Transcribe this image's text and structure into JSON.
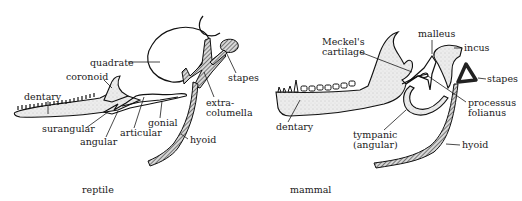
{
  "figure": {
    "panels": [
      {
        "id": "reptile",
        "caption": "reptile",
        "labels": {
          "quadrate": "quadrate",
          "coronoid": "coronoid",
          "dentary": "dentary",
          "stapes": "stapes",
          "extra1": "extra-",
          "extra2": "columella",
          "gonial": "gonial",
          "surangular": "surangular",
          "articular": "articular",
          "angular": "angular",
          "hyoid": "hyoid"
        }
      },
      {
        "id": "mammal",
        "caption": "mammal",
        "labels": {
          "meckel1": "Meckel's",
          "meckel2": "cartilage",
          "malleus": "malleus",
          "incus": "incus",
          "stapes": "stapes",
          "dentary": "dentary",
          "processus1": "processus",
          "processus2": "folianus",
          "tympanic1": "tympanic",
          "tympanic2": "(angular)",
          "hyoid": "hyoid"
        }
      }
    ]
  }
}
